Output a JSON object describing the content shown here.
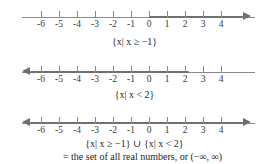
{
  "figure": {
    "kind": "number-line-set-notation",
    "axis": {
      "tick_values": [
        -6,
        -5,
        -4,
        -3,
        -2,
        -1,
        0,
        1,
        2,
        3,
        4
      ],
      "tick_labels": [
        "-6",
        "-5",
        "-4",
        "-3",
        "-2",
        "-1",
        "0",
        "1",
        "2",
        "3",
        "4"
      ],
      "line_color": "#8a8a8a",
      "highlight_color": "#6f6f6f"
    },
    "lines": [
      {
        "id": "line-1",
        "description": "x greater than or equal to negative one",
        "highlight_from": -1,
        "highlight_to": 4.6,
        "left_arrow": false,
        "right_arrow": true,
        "right_arrow_bold": true,
        "caption": "{x| x ≥ −1}",
        "caption_parts": {
          "open_brace": "{",
          "set_var": "x",
          "divider": "|",
          "condition_var": "x",
          "relation": "≥",
          "value": "−1",
          "close_brace": "}"
        }
      },
      {
        "id": "line-2",
        "description": "x less than two",
        "highlight_from": -6.6,
        "highlight_to": 2,
        "left_arrow": true,
        "left_arrow_bold": true,
        "right_arrow": false,
        "caption": "{x| x < 2}",
        "caption_parts": {
          "open_brace": "{",
          "set_var": "x",
          "divider": "|",
          "condition_var": "x",
          "relation": "<",
          "value": "2",
          "close_brace": "}"
        }
      },
      {
        "id": "line-3",
        "description": "all real numbers",
        "highlight_from": -6.6,
        "highlight_to": 4.6,
        "left_arrow": true,
        "left_arrow_bold": true,
        "right_arrow": true,
        "right_arrow_bold": true,
        "caption": "{x| x ≥ −1} ∪ {x| x < 2}",
        "caption_line2": "= the set of all real numbers, or (−∞, ∞)"
      }
    ],
    "captions": {
      "line1": "{x| x ≥ −1}",
      "line2": "{x| x < 2}",
      "line3_union": "{x| x ≥ −1} ∪ {x| x < 2}",
      "line3_result": "= the set of all real numbers, or (−∞, ∞)"
    },
    "symbols": {
      "union": "∪",
      "geq": "≥",
      "lt": "<",
      "infinity": "∞",
      "minus": "−",
      "equals": "=",
      "such_that": "|"
    }
  }
}
